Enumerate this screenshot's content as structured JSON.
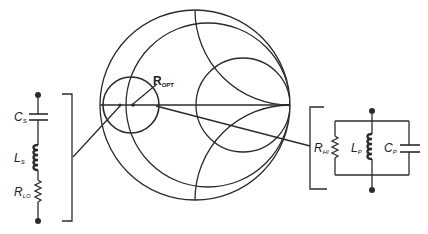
{
  "colors": {
    "ink": "#2b2b2b",
    "background": "#ffffff"
  },
  "smith_chart": {
    "marker_label": "R",
    "marker_subscript": "OPT"
  },
  "series_network": {
    "components": [
      {
        "type": "capacitor",
        "symbol": "C",
        "subscript": "S"
      },
      {
        "type": "inductor",
        "symbol": "L",
        "subscript": "S"
      },
      {
        "type": "resistor",
        "symbol": "R",
        "subscript": "LO"
      }
    ]
  },
  "parallel_network": {
    "components": [
      {
        "type": "resistor",
        "symbol": "R",
        "subscript": "HI"
      },
      {
        "type": "inductor",
        "symbol": "L",
        "subscript": "P"
      },
      {
        "type": "capacitor",
        "symbol": "C",
        "subscript": "P"
      }
    ]
  }
}
